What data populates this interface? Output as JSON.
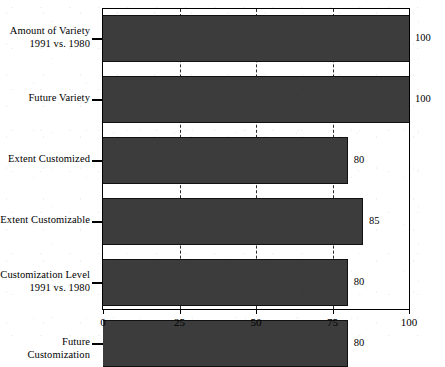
{
  "chart_data": {
    "type": "bar",
    "orientation": "horizontal",
    "title": "",
    "xlabel": "",
    "ylabel": "",
    "xlim": [
      0,
      100
    ],
    "xticks": [
      "0",
      "25",
      "50",
      "75",
      "100"
    ],
    "xtick_values": [
      0,
      25,
      50,
      75,
      100
    ],
    "grid": "vertical-dashed",
    "gridline_values": [
      25,
      50,
      75
    ],
    "legend": "none",
    "bar_color": "#3c3c3c",
    "bar_edge_color": "#111111",
    "background_color": "#ffffff",
    "axis_color": "#000000",
    "categories": [
      "Amount of Variety\n1991 vs. 1980",
      "Future Variety",
      "Extent Customized",
      "Extent Customizable",
      "Customization Level\n1991 vs. 1980",
      "Future Customization"
    ],
    "values": [
      100,
      100,
      80,
      85,
      80,
      80
    ],
    "value_labels": [
      "100",
      "100",
      "80",
      "85",
      "80",
      "80"
    ]
  }
}
